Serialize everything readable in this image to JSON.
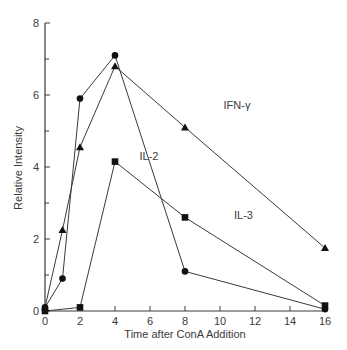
{
  "chart_data": {
    "type": "line",
    "title": "",
    "xlabel": "Time after ConA  Addition",
    "ylabel": "Relative Intensity",
    "xlim": [
      0,
      16
    ],
    "ylim": [
      0,
      8
    ],
    "x_ticks": [
      0,
      2,
      4,
      6,
      8,
      10,
      12,
      14,
      16
    ],
    "y_ticks": [
      0,
      2,
      4,
      6,
      8
    ],
    "y_minor_ticks": [
      1,
      3,
      5,
      7
    ],
    "grid": false,
    "legend": "inline labels",
    "series": [
      {
        "name": "IL-2",
        "marker": "circle",
        "x": [
          0,
          1,
          2,
          4,
          8,
          16
        ],
        "y": [
          0.1,
          0.9,
          5.9,
          7.1,
          1.1,
          0.05
        ],
        "label_pos": {
          "x": 5.4,
          "y": 4.2
        }
      },
      {
        "name": "IFN-γ",
        "marker": "triangle",
        "x": [
          0,
          1,
          2,
          4,
          8,
          16
        ],
        "y": [
          0.1,
          2.25,
          4.55,
          6.8,
          5.1,
          1.75
        ],
        "label_pos": {
          "x": 10.2,
          "y": 5.6
        }
      },
      {
        "name": "IL-3",
        "marker": "square",
        "x": [
          0,
          2,
          4,
          8,
          16
        ],
        "y": [
          0.0,
          0.1,
          4.15,
          2.6,
          0.15
        ],
        "label_pos": {
          "x": 10.8,
          "y": 2.55
        }
      }
    ],
    "line_color": "#3a3a3a",
    "marker_color": "#111111"
  }
}
